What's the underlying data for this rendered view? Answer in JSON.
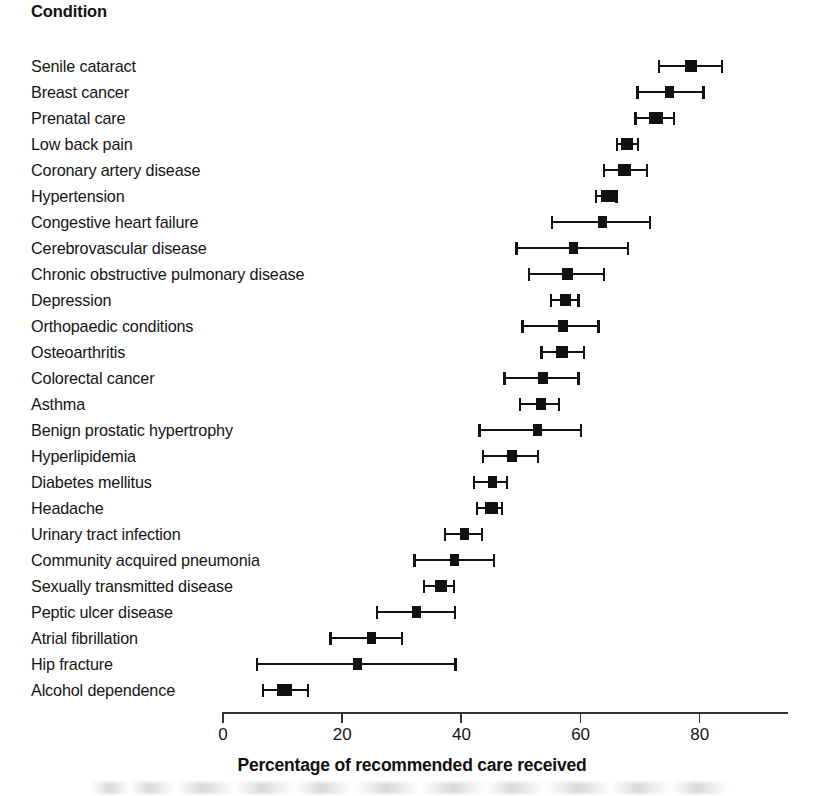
{
  "header": {
    "column_title": "Condition"
  },
  "axis": {
    "title": "Percentage of recommended care received",
    "ticks": [
      0,
      20,
      40,
      60,
      80
    ],
    "min": 0,
    "max": 95
  },
  "chart_data": {
    "type": "scatter",
    "subtype": "forest-plot",
    "title": "",
    "xlabel": "Percentage of recommended care received",
    "ylabel": "Condition",
    "xlim": [
      0,
      95
    ],
    "ylim": null,
    "grid": false,
    "legend": null,
    "xticks": [
      0,
      20,
      40,
      60,
      80
    ],
    "orientation": "horizontal",
    "value_key": "value",
    "error_keys": [
      "ci_low",
      "ci_high"
    ],
    "categories": [
      "Senile cataract",
      "Breast cancer",
      "Prenatal care",
      "Low back pain",
      "Coronary artery disease",
      "Hypertension",
      "Congestive heart failure",
      "Cerebrovascular disease",
      "Chronic obstructive pulmonary disease",
      "Depression",
      "Orthopaedic conditions",
      "Osteoarthritis",
      "Colorectal cancer",
      "Asthma",
      "Benign prostatic hypertrophy",
      "Hyperlipidemia",
      "Diabetes mellitus",
      "Headache",
      "Urinary tract infection",
      "Community acquired pneumonia",
      "Sexually transmitted disease",
      "Peptic ulcer disease",
      "Atrial fibrillation",
      "Hip fracture",
      "Alcohol dependence"
    ],
    "values": [
      78.7,
      75.0,
      72.8,
      68.0,
      67.6,
      64.7,
      63.9,
      58.9,
      58.0,
      57.7,
      57.2,
      57.0,
      53.9,
      53.5,
      53.0,
      48.6,
      45.4,
      45.2,
      40.7,
      39.0,
      36.7,
      32.7,
      25.0,
      22.8,
      10.5
    ],
    "ci_low": [
      73.1,
      69.5,
      69.2,
      66.1,
      63.9,
      62.6,
      55.2,
      49.2,
      51.3,
      55.0,
      50.2,
      53.4,
      47.2,
      49.8,
      43.0,
      43.6,
      42.1,
      42.6,
      37.2,
      32.1,
      33.7,
      25.8,
      18.0,
      5.7,
      6.7
    ],
    "ci_high": [
      84.1,
      81.0,
      76.0,
      70.0,
      71.5,
      66.4,
      72.0,
      68.3,
      64.3,
      60.0,
      63.4,
      60.9,
      60.0,
      56.7,
      60.4,
      53.2,
      48.0,
      47.2,
      43.8,
      45.8,
      39.1,
      39.3,
      30.4,
      39.4,
      14.6
    ],
    "marker_widths": [
      12,
      9,
      14,
      12,
      13,
      14,
      9,
      9,
      11,
      11,
      10,
      12,
      10,
      10,
      9,
      10,
      9,
      13,
      9,
      9,
      12,
      9,
      9,
      9,
      15
    ]
  }
}
